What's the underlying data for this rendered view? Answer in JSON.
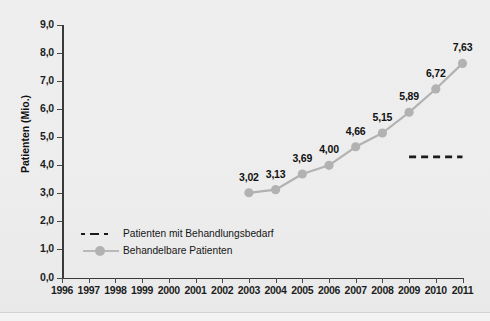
{
  "chart_data": {
    "type": "line",
    "title": "",
    "xlabel": "",
    "ylabel": "Patienten (Mio.)",
    "xlim": [
      1996,
      2011
    ],
    "ylim": [
      0.0,
      9.0
    ],
    "grid": false,
    "legend_position": "inside-lower-left",
    "x_tick_labels": [
      "1996",
      "1997",
      "1998",
      "1999",
      "2000",
      "2001",
      "2002",
      "2003",
      "2004",
      "2005",
      "2006",
      "2007",
      "2008",
      "2009",
      "2010",
      "2011"
    ],
    "y_tick_labels": [
      "0,0",
      "1,0",
      "2,0",
      "3,0",
      "4,0",
      "5,0",
      "6,0",
      "7,0",
      "8,0",
      "9,0"
    ],
    "y_tick_values": [
      0.0,
      1.0,
      2.0,
      3.0,
      4.0,
      5.0,
      6.0,
      7.0,
      8.0,
      9.0
    ],
    "series": [
      {
        "name": "Behandelbare Patienten",
        "style": "line-marker",
        "color": "#b2b2b2",
        "x": [
          2003,
          2004,
          2005,
          2006,
          2007,
          2008,
          2009,
          2010,
          2011
        ],
        "values": [
          3.02,
          3.13,
          3.69,
          4.0,
          4.66,
          5.15,
          5.89,
          6.72,
          7.63
        ],
        "data_labels": [
          "3,02",
          "3,13",
          "3,69",
          "4,00",
          "4,66",
          "5,15",
          "5,89",
          "6,72",
          "7,63"
        ]
      },
      {
        "name": "Patienten mit Behandlungsbedarf",
        "style": "dashed",
        "color": "#1a1a1a",
        "x": [
          2009,
          2011
        ],
        "values": [
          4.3,
          4.3
        ],
        "data_labels": []
      }
    ]
  },
  "legend": {
    "items": [
      {
        "label": "Patienten mit Behandlungsbedarf",
        "marker": "dashed-line"
      },
      {
        "label": "Behandelbare Patienten",
        "marker": "line-with-circle"
      }
    ]
  },
  "colors": {
    "background": "#eeeeee",
    "axis": "#3a3a3a",
    "series_gray": "#b2b2b2",
    "series_dashed": "#1a1a1a",
    "text": "#111111"
  }
}
